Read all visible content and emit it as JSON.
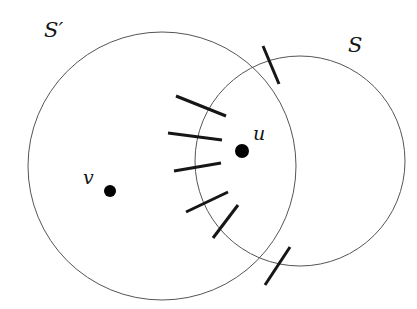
{
  "figure": {
    "type": "venn-like-diagram",
    "background_color": "#ffffff",
    "stroke_color": "#555555",
    "hatch_color": "#161616",
    "point_color": "#000000",
    "labels": {
      "set_outer": "S′",
      "set_inner": "S",
      "vertex_u": "u",
      "vertex_v": "v"
    },
    "circles": [
      {
        "name": "S-prime",
        "label": "S′",
        "cx": 162,
        "cy": 166,
        "r": 134,
        "stroke_width": 1
      },
      {
        "name": "S",
        "label": "S",
        "cx": 300,
        "cy": 161,
        "r": 105,
        "stroke_width": 1
      }
    ],
    "points": [
      {
        "name": "u",
        "label": "u",
        "cx": 242,
        "cy": 151,
        "r": 7
      },
      {
        "name": "v",
        "label": "v",
        "cx": 110,
        "cy": 191,
        "r": 6
      }
    ],
    "hatch_marks": [
      {
        "x1": 176,
        "y1": 96,
        "x2": 226,
        "y2": 116
      },
      {
        "x1": 168,
        "y1": 133,
        "x2": 222,
        "y2": 140
      },
      {
        "x1": 174,
        "y1": 171,
        "x2": 221,
        "y2": 163
      },
      {
        "x1": 186,
        "y1": 212,
        "x2": 228,
        "y2": 192
      },
      {
        "x1": 213,
        "y1": 238,
        "x2": 238,
        "y2": 205
      },
      {
        "x1": 263,
        "y1": 46,
        "x2": 279,
        "y2": 84
      },
      {
        "x1": 290,
        "y1": 247,
        "x2": 265,
        "y2": 285
      }
    ]
  }
}
